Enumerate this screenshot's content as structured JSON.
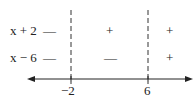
{
  "rows": [
    {
      "label": "x + 2",
      "signs": [
        "—",
        "+",
        "+"
      ]
    },
    {
      "label": "x − 6",
      "signs": [
        "—",
        "—",
        "+"
      ]
    }
  ],
  "critical_points": [
    "−2",
    "6"
  ]
}
